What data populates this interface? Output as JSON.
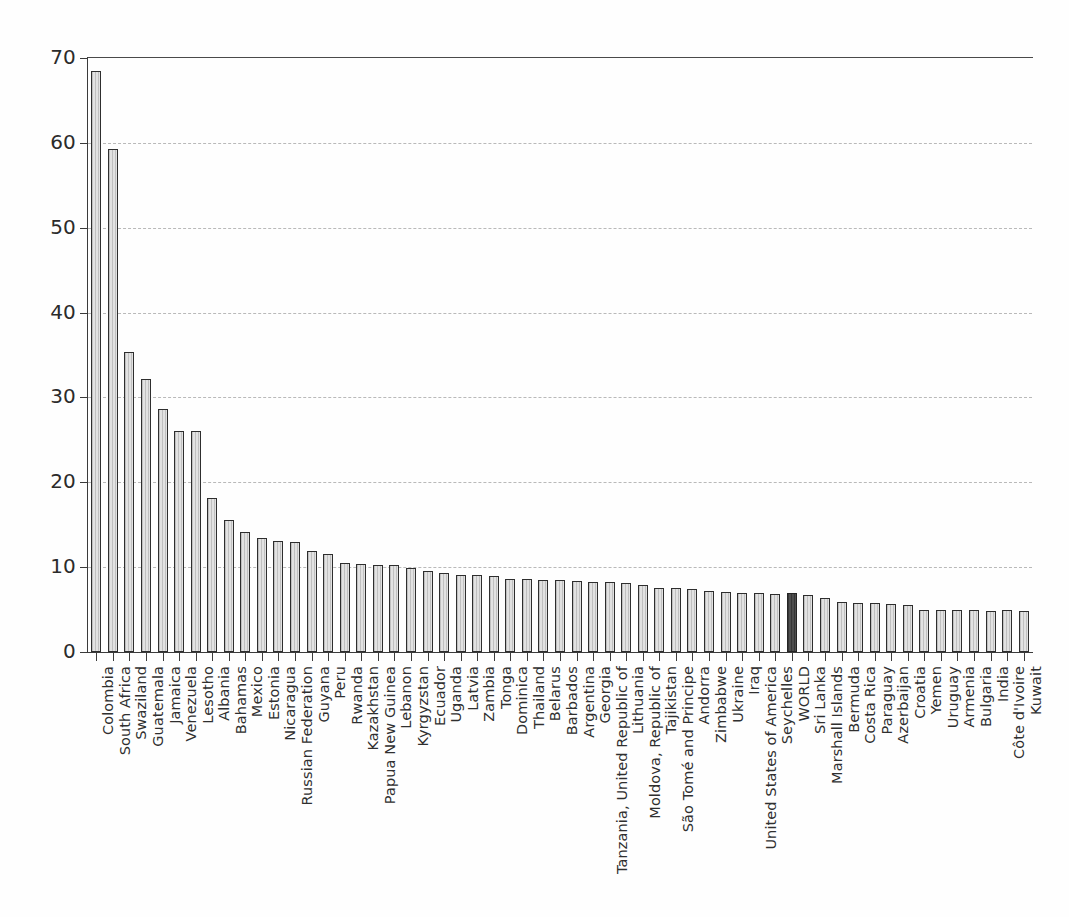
{
  "chart_data": {
    "type": "bar",
    "title": "",
    "subtitle": "",
    "xlabel": "",
    "ylabel": "",
    "ylim": [
      0,
      70
    ],
    "yticks": [
      0,
      10,
      20,
      30,
      40,
      50,
      60,
      70
    ],
    "ytick_labels": [
      "0",
      "10",
      "20",
      "30",
      "40",
      "50",
      "60",
      "70"
    ],
    "grid": "horizontal-dashed",
    "legend": "none",
    "highlight_category": "WORLD",
    "highlight_color": "#4e4e4e",
    "bar_color": "#e2e2e2",
    "bar_edge_color": "#2e2e2e",
    "categories": [
      "Colombia",
      "South Africa",
      "Swaziland",
      "Guatemala",
      "Jamaica",
      "Venezuela",
      "Lesotho",
      "Albania",
      "Bahamas",
      "Mexico",
      "Estonia",
      "Nicaragua",
      "Russian Federation",
      "Guyana",
      "Peru",
      "Rwanda",
      "Kazakhstan",
      "Papua New Guinea",
      "Lebanon",
      "Kyrgyzstan",
      "Ecuador",
      "Uganda",
      "Latvia",
      "Zambia",
      "Tonga",
      "Dominica",
      "Thailand",
      "Belarus",
      "Barbados",
      "Argentina",
      "Georgia",
      "Tanzania, United Republic of",
      "Lithuania",
      "Moldova, Republic of",
      "Tajikistan",
      "São Tomé and Principe",
      "Andorra",
      "Zimbabwe",
      "Ukraine",
      "Iraq",
      "United States of America",
      "Seychelles",
      "WORLD",
      "Sri Lanka",
      "Marshall Islands",
      "Bermuda",
      "Costa Rica",
      "Paraguay",
      "Azerbaijan",
      "Croatia",
      "Yemen",
      "Uruguay",
      "Armenia",
      "Bulgaria",
      "India",
      "Côte d'Ivoire",
      "Kuwait"
    ],
    "values": [
      68.5,
      59.3,
      35.4,
      32.2,
      28.6,
      26.1,
      26.1,
      18.1,
      15.6,
      14.2,
      13.4,
      13.1,
      13.0,
      11.9,
      11.5,
      10.5,
      10.4,
      10.3,
      10.2,
      9.9,
      9.6,
      9.3,
      9.1,
      9.1,
      8.9,
      8.6,
      8.6,
      8.5,
      8.5,
      8.4,
      8.2,
      8.2,
      8.1,
      7.9,
      7.6,
      7.5,
      7.4,
      7.2,
      7.1,
      7.0,
      6.9,
      6.8,
      6.9,
      6.7,
      6.4,
      5.9,
      5.8,
      5.8,
      5.7,
      5.5,
      5.0,
      4.9,
      4.9,
      4.9,
      4.8,
      4.9,
      4.8
    ]
  }
}
